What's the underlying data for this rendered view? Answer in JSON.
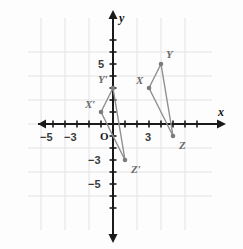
{
  "figure": {
    "background_color": "#fdfdfd",
    "grid_color": "#e3e3e8",
    "axis_color": "#1a1a1a",
    "shape_stroke_color": "#8f8f8f",
    "vertex_fill_color": "#7c7c7c",
    "label_color": "#6b6b6b"
  },
  "axes": {
    "x_name": "x",
    "y_name": "y",
    "origin_label": "O",
    "x_ticks": [
      {
        "value": -5,
        "label": "−5"
      },
      {
        "value": -3,
        "label": "−3"
      },
      {
        "value": 3,
        "label": "3"
      }
    ],
    "y_ticks": [
      {
        "value": 5,
        "label": "5"
      },
      {
        "value": -3,
        "label": "−3"
      },
      {
        "value": -5,
        "label": "−5"
      }
    ],
    "x_range": [
      -7,
      7
    ],
    "y_range": [
      -7,
      7
    ],
    "grid_step": 2,
    "tick_step": 1
  },
  "chart_data": {
    "type": "scatter",
    "xlabel": "x",
    "ylabel": "y",
    "xlim": [
      -7,
      7
    ],
    "ylim": [
      -7,
      7
    ],
    "grid": true,
    "legend": "none",
    "series": [
      {
        "name": "Triangle XYZ",
        "closed": true,
        "points": [
          {
            "label": "X",
            "x": 3,
            "y": 3,
            "label_dx": -13,
            "label_dy": -13
          },
          {
            "label": "Y",
            "x": 4,
            "y": 5,
            "label_dx": 5,
            "label_dy": -15
          },
          {
            "label": "Z",
            "x": 5,
            "y": -1,
            "label_dx": 6,
            "label_dy": 4
          }
        ]
      },
      {
        "name": "Triangle X'Y'Z'",
        "closed": true,
        "points": [
          {
            "label": "X′",
            "x": -1,
            "y": 1,
            "label_dx": -16,
            "label_dy": -13
          },
          {
            "label": "Y′",
            "x": 0,
            "y": 3,
            "label_dx": -15,
            "label_dy": -14
          },
          {
            "label": "Z′",
            "x": 1,
            "y": -3,
            "label_dx": 6,
            "label_dy": 4
          }
        ]
      }
    ]
  }
}
